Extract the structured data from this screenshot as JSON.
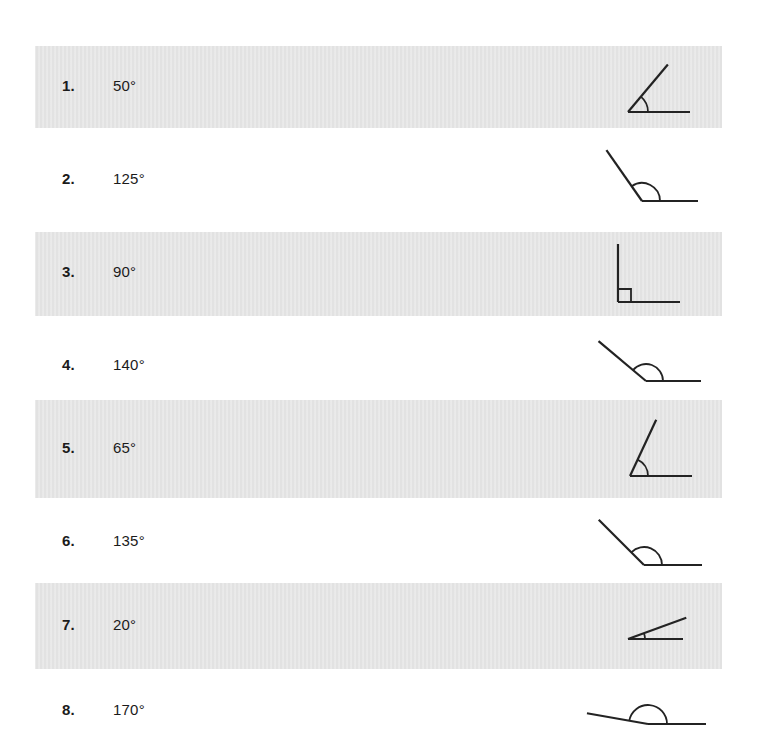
{
  "document": {
    "type": "angle-measurement-worksheet",
    "page_background": "#ffffff",
    "band_color": "#e2e2e2",
    "ink_color": "#232323",
    "text_color": "#1b1b1b"
  },
  "rows": [
    {
      "number": "1.",
      "value": "50°",
      "degrees": 50,
      "shaded": true,
      "marker": "arc",
      "arc_radius": 20,
      "ray_length": 62,
      "baseline_length": 62,
      "orientation": "vertex-left"
    },
    {
      "number": "2.",
      "value": "125°",
      "degrees": 125,
      "shaded": false,
      "marker": "arc",
      "arc_radius": 18,
      "ray_length": 62,
      "baseline_length": 56,
      "orientation": "vertex-left"
    },
    {
      "number": "3.",
      "value": "90°",
      "degrees": 90,
      "shaded": true,
      "marker": "right-angle-square",
      "arc_radius": 13,
      "ray_length": 58,
      "baseline_length": 62,
      "orientation": "vertex-left"
    },
    {
      "number": "4.",
      "value": "140°",
      "degrees": 140,
      "shaded": false,
      "marker": "arc",
      "arc_radius": 17,
      "ray_length": 62,
      "baseline_length": 55,
      "orientation": "vertex-left"
    },
    {
      "number": "5.",
      "value": "65°",
      "degrees": 65,
      "shaded": true,
      "marker": "arc",
      "arc_radius": 18,
      "ray_length": 62,
      "baseline_length": 62,
      "orientation": "vertex-left"
    },
    {
      "number": "6.",
      "value": "135°",
      "degrees": 135,
      "shaded": false,
      "marker": "arc",
      "arc_radius": 18,
      "ray_length": 64,
      "baseline_length": 58,
      "orientation": "vertex-left"
    },
    {
      "number": "7.",
      "value": "20°",
      "degrees": 20,
      "shaded": true,
      "marker": "arc",
      "arc_radius": 17,
      "ray_length": 62,
      "baseline_length": 55,
      "orientation": "vertex-left"
    },
    {
      "number": "8.",
      "value": "170°",
      "degrees": 170,
      "shaded": false,
      "marker": "arc",
      "arc_radius": 19,
      "ray_length": 62,
      "baseline_length": 58,
      "orientation": "vertex-left"
    }
  ],
  "layout": {
    "rows_geometry": [
      {
        "top": 46,
        "height": 82,
        "text_baseline": 42,
        "fig_left": 596,
        "fig_top": 8,
        "fig_w": 130,
        "fig_h": 70,
        "vertex_x": 32,
        "vertex_y": 58
      },
      {
        "top": 145,
        "height": 70,
        "text_baseline": 36,
        "fig_left": 596,
        "fig_top": 2,
        "fig_w": 130,
        "fig_h": 62,
        "vertex_x": 46,
        "vertex_y": 54
      },
      {
        "top": 232,
        "height": 84,
        "text_baseline": 42,
        "fig_left": 596,
        "fig_top": 6,
        "fig_w": 130,
        "fig_h": 72,
        "vertex_x": 22,
        "vertex_y": 64
      },
      {
        "top": 331,
        "height": 70,
        "text_baseline": 36,
        "fig_left": 596,
        "fig_top": 2,
        "fig_w": 130,
        "fig_h": 62,
        "vertex_x": 50,
        "vertex_y": 48
      },
      {
        "top": 400,
        "height": 98,
        "text_baseline": 50,
        "fig_left": 596,
        "fig_top": 14,
        "fig_w": 130,
        "fig_h": 72,
        "vertex_x": 34,
        "vertex_y": 62
      },
      {
        "top": 505,
        "height": 72,
        "text_baseline": 38,
        "fig_left": 596,
        "fig_top": 4,
        "fig_w": 130,
        "fig_h": 64,
        "vertex_x": 48,
        "vertex_y": 56
      },
      {
        "top": 583,
        "height": 86,
        "text_baseline": 44,
        "fig_left": 596,
        "fig_top": 10,
        "fig_w": 130,
        "fig_h": 62,
        "vertex_x": 32,
        "vertex_y": 46
      },
      {
        "top": 676,
        "height": 68,
        "text_baseline": 36,
        "fig_left": 596,
        "fig_top": 12,
        "fig_w": 140,
        "fig_h": 56,
        "vertex_x": 52,
        "vertex_y": 36
      }
    ]
  }
}
